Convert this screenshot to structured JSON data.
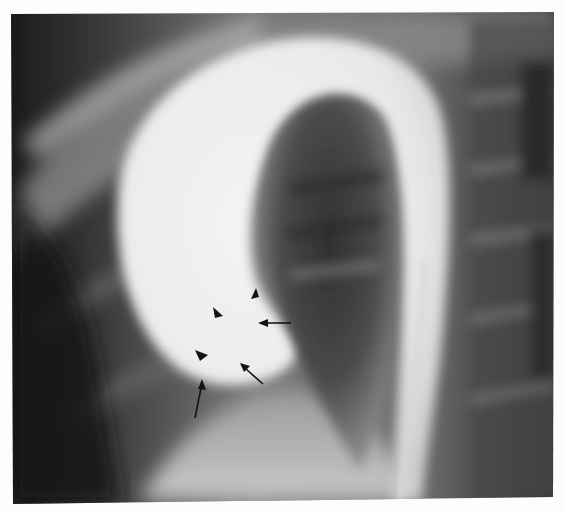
{
  "figure": {
    "type": "radiograph",
    "modality": "aortogram-lateral-view",
    "background_color": "#fdfdfd",
    "film_dark": "#1a1a1a",
    "contrast_bright": "#f2f2f2",
    "annotation_color": "#141414"
  },
  "annotations": {
    "arrowheads": [
      {
        "name": "arrowhead-top",
        "tip": [
          256,
          289
        ],
        "direction": "up"
      },
      {
        "name": "arrowhead-middle",
        "tip": [
          222,
          315
        ],
        "direction": "down-right"
      },
      {
        "name": "arrowhead-lower",
        "tip": [
          207,
          357
        ],
        "direction": "right"
      }
    ],
    "arrows": [
      {
        "name": "arrow-horizontal",
        "tip": [
          258,
          323
        ],
        "tail": [
          291,
          323
        ]
      },
      {
        "name": "arrow-diagonal",
        "tip": [
          240,
          363
        ],
        "tail": [
          263,
          384
        ]
      },
      {
        "name": "arrow-vertical",
        "tip": [
          202,
          379
        ],
        "tail": [
          195,
          418
        ]
      }
    ]
  }
}
